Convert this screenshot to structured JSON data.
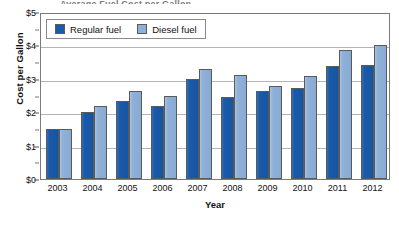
{
  "chart_data": {
    "type": "bar",
    "title": "",
    "xlabel": "Year",
    "ylabel": "Cost per Gallon",
    "categories": [
      "2003",
      "2004",
      "2005",
      "2006",
      "2007",
      "2008",
      "2009",
      "2010",
      "2011",
      "2012"
    ],
    "series": [
      {
        "name": "Regular fuel",
        "color": "#1B5AA8",
        "values": [
          1.5,
          2.0,
          2.35,
          2.2,
          3.0,
          2.45,
          2.65,
          2.72,
          3.38,
          3.4
        ]
      },
      {
        "name": "Diesel fuel",
        "color": "#8FB0D8",
        "values": [
          1.5,
          2.2,
          2.65,
          2.5,
          3.3,
          3.1,
          2.78,
          3.07,
          3.85,
          4.0
        ]
      }
    ],
    "ylim": [
      0,
      5
    ],
    "ytick_labels": [
      "$0",
      "$1",
      "$2",
      "$3",
      "$4",
      "$5"
    ],
    "ytick_values": [
      0,
      1,
      2,
      3,
      4,
      5
    ],
    "yminor_values": [
      0.5,
      1.5,
      2.5,
      3.5,
      4.5
    ],
    "grid": true,
    "legend_position": "top-left"
  },
  "legend": {
    "entries": [
      {
        "label": "Regular fuel",
        "swatch": "regular-fuel-swatch"
      },
      {
        "label": "Diesel fuel",
        "swatch": "diesel-fuel-swatch"
      }
    ]
  },
  "title_sliver": "Average Fuel Cost per Gallon"
}
